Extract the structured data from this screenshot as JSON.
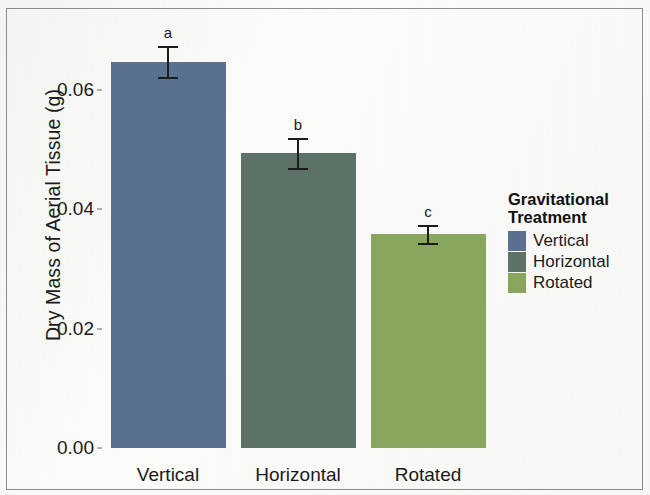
{
  "chart_data": {
    "type": "bar",
    "title": "",
    "xlabel": "",
    "ylabel": "Dry Mass of Aerial Tissue (g)",
    "categories": [
      "Vertical",
      "Horizontal",
      "Rotated"
    ],
    "values": [
      0.0647,
      0.0494,
      0.0359
    ],
    "errors": [
      0.0026,
      0.0025,
      0.0015
    ],
    "point_labels": [
      "a",
      "b",
      "c"
    ],
    "colors": [
      "#5b7292",
      "#5e7468",
      "#8aa85e"
    ],
    "ylim": [
      0.0,
      0.072
    ],
    "yticks": [
      "0.00",
      "0.02",
      "0.04",
      "0.06"
    ],
    "ytick_values": [
      0.0,
      0.02,
      0.04,
      0.06
    ],
    "grid": false,
    "legend_position": "right",
    "legend_title": "Gravitational\nTreatment",
    "legend_entries": [
      "Vertical",
      "Horizontal",
      "Rotated"
    ]
  },
  "axes": {
    "y_axis_label": "Dry Mass of Aerial Tissue (g)"
  }
}
